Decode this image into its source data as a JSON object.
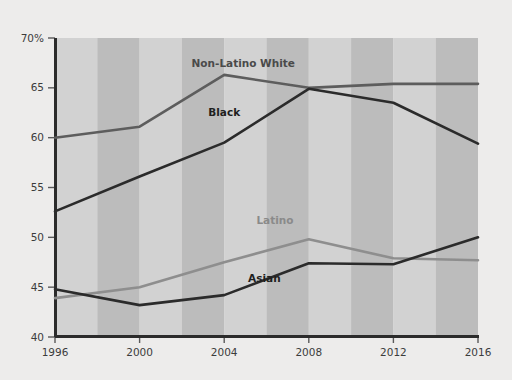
{
  "chart_data": {
    "type": "line",
    "title": "",
    "subtitle": "",
    "xlabel": "",
    "ylabel": "",
    "x": [
      1996,
      2000,
      2004,
      2008,
      2012,
      2016
    ],
    "categories": [
      "1996",
      "2000",
      "2004",
      "2008",
      "2012",
      "2016"
    ],
    "xtick_labels": [
      "1996",
      "2000",
      "2004",
      "2008",
      "2012",
      "2016"
    ],
    "ytick_labels": [
      "70%",
      "65",
      "60",
      "55",
      "50",
      "45",
      "40"
    ],
    "ytick_values": [
      70,
      65,
      60,
      55,
      50,
      45,
      40
    ],
    "ylim": [
      40,
      70
    ],
    "xlim": [
      1996,
      2016
    ],
    "grid": false,
    "banded_background": true,
    "legend_position": "inline-labels",
    "series": [
      {
        "name": "Non-Latino White",
        "color": "#5d5d5d",
        "label_color": "#4a4a4a",
        "values": [
          60.0,
          61.1,
          66.3,
          65.0,
          65.4,
          65.4
        ]
      },
      {
        "name": "Black",
        "color": "#2b2b2b",
        "label_color": "#1f1f1f",
        "values": [
          52.6,
          56.1,
          59.5,
          64.9,
          63.5,
          59.4
        ]
      },
      {
        "name": "Latino",
        "color": "#8e8e8e",
        "label_color": "#8a8a8a",
        "values": [
          43.9,
          45.0,
          47.5,
          49.8,
          47.9,
          47.7
        ]
      },
      {
        "name": "Asian",
        "color": "#2b2b2b",
        "label_color": "#1f1f1f",
        "values": [
          44.8,
          43.2,
          44.2,
          47.4,
          47.3,
          50.0
        ]
      }
    ],
    "annotations": [
      {
        "text": "Non-Latino White",
        "x": 2004.9,
        "y": 67.1
      },
      {
        "text": "Black",
        "x": 2004.0,
        "y": 62.2
      },
      {
        "text": "Latino",
        "x": 2006.4,
        "y": 51.3
      },
      {
        "text": "Asian",
        "x": 2005.9,
        "y": 45.5
      }
    ],
    "colors": {
      "background": "#edeceb",
      "plot_band_light": "#d2d2d2",
      "plot_band_dark": "#bcbcbc",
      "axis": "#2b2b2b",
      "tick_text": "#3c3c3c"
    }
  }
}
